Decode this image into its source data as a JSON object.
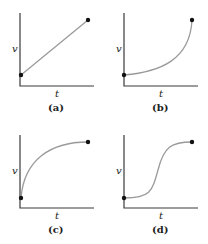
{
  "figure": {
    "panels": [
      {
        "id": "a",
        "caption": "(a)",
        "xlabel": "t",
        "ylabel": "v",
        "shape": "linear increasing"
      },
      {
        "id": "b",
        "caption": "(b)",
        "xlabel": "t",
        "ylabel": "v",
        "shape": "concave up, increasing rapidly at end"
      },
      {
        "id": "c",
        "caption": "(c)",
        "xlabel": "t",
        "ylabel": "v",
        "shape": "concave down, leveling off"
      },
      {
        "id": "d",
        "caption": "(d)",
        "xlabel": "t",
        "ylabel": "v",
        "shape": "sigmoid (S-curve)"
      }
    ],
    "colors": {
      "axis": "#3a3a3a",
      "curve": "#9a9a9a",
      "dot": "#111111"
    }
  }
}
